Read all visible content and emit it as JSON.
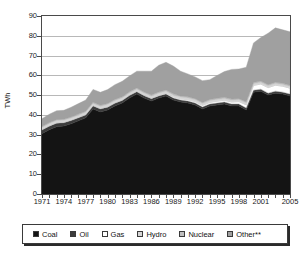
{
  "chart_data": {
    "type": "area",
    "title": "",
    "subtitle": "",
    "xlabel": "",
    "ylabel": "TWh",
    "ylim": [
      0,
      90
    ],
    "ytick_step": 10,
    "ytick_labels": [
      "0",
      "10",
      "20",
      "30",
      "40",
      "50",
      "60",
      "70",
      "80",
      "90"
    ],
    "xlim": [
      1971,
      2005
    ],
    "xtick_labels": [
      "1971",
      "1974",
      "1977",
      "1980",
      "1983",
      "1986",
      "1989",
      "1992",
      "1995",
      "1998",
      "2001",
      "2005"
    ],
    "grid": "horizontal",
    "stacked": true,
    "legend_position": "bottom",
    "x": [
      1971,
      1972,
      1973,
      1974,
      1975,
      1976,
      1977,
      1978,
      1979,
      1980,
      1981,
      1982,
      1983,
      1984,
      1985,
      1986,
      1987,
      1988,
      1989,
      1990,
      1991,
      1992,
      1993,
      1994,
      1995,
      1996,
      1997,
      1998,
      1999,
      2000,
      2001,
      2002,
      2003,
      2004,
      2005
    ],
    "series": [
      {
        "name": "Coal",
        "color": "#141414",
        "values": [
          30.5,
          32.5,
          34.0,
          34.4,
          35.5,
          37.0,
          38.5,
          43.0,
          41.5,
          42.5,
          44.5,
          46.0,
          48.5,
          50.5,
          48.5,
          47.0,
          48.5,
          49.5,
          47.5,
          46.5,
          46.0,
          45.0,
          43.0,
          44.5,
          45.0,
          45.5,
          44.5,
          44.5,
          42.5,
          51.5,
          52.0,
          50.0,
          51.0,
          50.5,
          49.5
        ]
      },
      {
        "name": "Oil",
        "color": "#3c3c3c",
        "values": [
          1.8,
          1.8,
          1.8,
          1.6,
          1.6,
          1.5,
          1.5,
          1.5,
          1.5,
          1.4,
          1.4,
          1.3,
          1.3,
          1.2,
          1.2,
          1.2,
          1.1,
          1.1,
          1.1,
          1.0,
          1.0,
          1.0,
          1.0,
          1.0,
          1.0,
          1.0,
          1.0,
          1.0,
          1.0,
          1.0,
          1.0,
          1.0,
          1.0,
          1.0,
          1.0
        ]
      },
      {
        "name": "Gas",
        "color": "#ffffff",
        "values": [
          0.4,
          0.4,
          0.4,
          0.4,
          0.4,
          0.4,
          0.4,
          0.4,
          0.4,
          0.4,
          0.4,
          0.4,
          0.4,
          0.4,
          0.4,
          0.4,
          0.5,
          0.5,
          0.6,
          0.6,
          0.7,
          0.7,
          0.8,
          0.8,
          0.9,
          0.9,
          1.0,
          1.2,
          1.6,
          2.4,
          2.6,
          2.8,
          3.0,
          3.0,
          3.0
        ]
      },
      {
        "name": "Hydro",
        "color": "#d6d6d6",
        "values": [
          0.9,
          0.9,
          0.9,
          0.9,
          0.9,
          0.9,
          0.9,
          0.9,
          0.9,
          0.9,
          0.9,
          0.9,
          0.9,
          0.9,
          0.9,
          0.9,
          0.9,
          0.9,
          0.9,
          0.9,
          0.9,
          0.9,
          0.9,
          0.9,
          0.9,
          0.9,
          0.9,
          0.9,
          0.9,
          0.9,
          0.9,
          0.9,
          0.9,
          0.9,
          0.9
        ]
      },
      {
        "name": "Nuclear",
        "color": "#bfbfbf",
        "values": [
          0.5,
          0.5,
          0.5,
          0.5,
          0.5,
          0.6,
          0.6,
          0.6,
          0.6,
          0.6,
          0.6,
          0.6,
          0.6,
          0.6,
          0.6,
          0.6,
          0.6,
          0.6,
          0.6,
          0.6,
          0.6,
          0.6,
          0.6,
          0.6,
          0.6,
          0.6,
          0.6,
          0.6,
          0.6,
          0.6,
          0.6,
          0.6,
          0.6,
          0.6,
          0.6
        ]
      },
      {
        "name": "Other**",
        "color": "#a0a0a0",
        "values": [
          4.0,
          4.2,
          4.5,
          4.5,
          5.0,
          5.3,
          5.6,
          6.5,
          6.5,
          7.0,
          7.5,
          7.8,
          8.0,
          8.5,
          10.5,
          12.0,
          13.5,
          14.0,
          14.0,
          12.5,
          11.5,
          11.0,
          11.0,
          10.0,
          11.5,
          13.0,
          15.0,
          15.0,
          17.5,
          20.0,
          22.0,
          26.0,
          27.5,
          27.0,
          27.0
        ]
      }
    ],
    "totals": [
      38.1,
      40.3,
      42.1,
      42.3,
      43.9,
      45.7,
      47.5,
      52.9,
      51.4,
      52.8,
      55.3,
      57.0,
      59.7,
      62.1,
      62.1,
      62.1,
      65.1,
      66.6,
      64.7,
      62.1,
      60.7,
      59.2,
      57.3,
      57.8,
      59.9,
      61.9,
      63.0,
      63.2,
      64.1,
      76.4,
      79.1,
      81.3,
      84.0,
      83.0,
      82.0
    ]
  },
  "legend": {
    "items": [
      {
        "label": "Coal",
        "color": "#141414"
      },
      {
        "label": "Oil",
        "color": "#3c3c3c"
      },
      {
        "label": "Gas",
        "color": "#ffffff"
      },
      {
        "label": "Hydro",
        "color": "#d6d6d6"
      },
      {
        "label": "Nuclear",
        "color": "#bfbfbf"
      },
      {
        "label": "Other**",
        "color": "#a0a0a0"
      }
    ]
  },
  "axes": {
    "y_title": "TWh"
  }
}
